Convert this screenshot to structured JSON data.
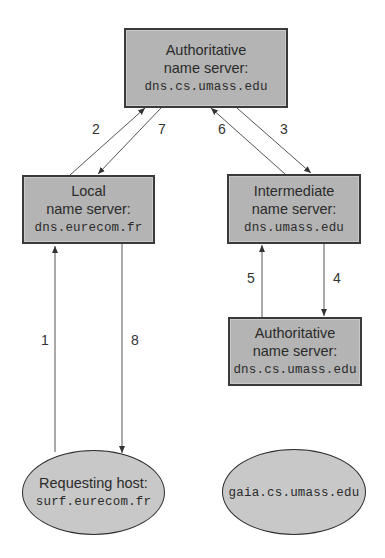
{
  "nodes": {
    "top_auth": {
      "line1": "Authoritative",
      "line2": "name server:",
      "host": "dns.cs.umass.edu"
    },
    "local": {
      "line1": "Local",
      "line2": "name server:",
      "host": "dns.eurecom.fr"
    },
    "intermediate": {
      "line1": "Intermediate",
      "line2": "name server:",
      "host": "dns.umass.edu"
    },
    "bottom_auth": {
      "line1": "Authoritative",
      "line2": "name server:",
      "host": "dns.cs.umass.edu"
    },
    "requesting": {
      "line1": "Requesting host:",
      "host": "surf.eurecom.fr"
    },
    "target": {
      "host": "gaia.cs.umass.edu"
    }
  },
  "edges": [
    {
      "label": "1",
      "from": "requesting",
      "to": "local"
    },
    {
      "label": "2",
      "from": "local",
      "to": "top_auth"
    },
    {
      "label": "3",
      "from": "top_auth",
      "to": "intermediate"
    },
    {
      "label": "4",
      "from": "intermediate",
      "to": "bottom_auth"
    },
    {
      "label": "5",
      "from": "bottom_auth",
      "to": "intermediate"
    },
    {
      "label": "6",
      "from": "intermediate",
      "to": "top_auth"
    },
    {
      "label": "7",
      "from": "top_auth",
      "to": "local"
    },
    {
      "label": "8",
      "from": "local",
      "to": "requesting"
    }
  ],
  "colors": {
    "box_fill": "#b4b4b4",
    "ellipse_fill": "#c8c8c8",
    "stroke": "#3a3a3a",
    "arrow": "#444444"
  }
}
